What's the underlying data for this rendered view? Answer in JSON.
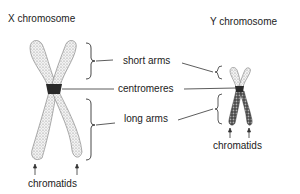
{
  "titles": {
    "x_chromosome": "X chromosome",
    "y_chromosome": "Y chromosome"
  },
  "labels": {
    "short_arms": "short arms",
    "centromeres": "centromeres",
    "long_arms": "long arms",
    "chromatids_x": "chromatids",
    "chromatids_y": "chromatids"
  },
  "colors": {
    "x_chromatid_fill": "#d8d8d8",
    "y_chromatid_fill": "#555555",
    "centromere_fill": "#2a2a2a",
    "line": "#333333"
  }
}
